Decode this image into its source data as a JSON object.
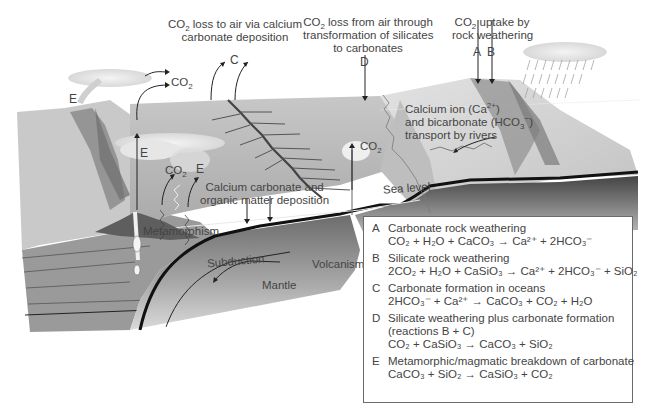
{
  "diagram": {
    "title_labels": {
      "c_label": {
        "line1_pre": "CO",
        "line1_sub": "2",
        "line1_post": " loss to air via calcium",
        "line2": "carbonate deposition",
        "letter": "C"
      },
      "d_label": {
        "line1_pre": "CO",
        "line1_sub": "2",
        "line1_post": " loss from air through",
        "line2": "transformation of silicates",
        "line3": "to carbonates",
        "letter": "D"
      },
      "ab_label": {
        "line1_pre": "CO",
        "line1_sub": "2",
        "line1_post": " uptake by",
        "line2": "rock weathering",
        "letter_a": "A",
        "letter_b": "B"
      }
    },
    "inline_labels": {
      "co2_top": {
        "pre": "CO",
        "sub": "2"
      },
      "co2_mid": {
        "pre": "CO",
        "sub": "2"
      },
      "co2_volcano": {
        "pre": "CO",
        "sub": "2"
      },
      "e_top": "E",
      "e_mid": "E",
      "e_small": "E",
      "river_line1_pre": "Calcium ion (Ca",
      "river_line1_sup": "2+",
      "river_line1_post": ")",
      "river_line2_pre": "and bicarbonate (HCO",
      "river_line2_sub": "3",
      "river_line2_sup": "−",
      "river_line2_post": ")",
      "river_line3": "transport by rivers",
      "deposition_line1": "Calcium carbonate and",
      "deposition_line2": "organic matter deposition",
      "sea_level": "Sea level",
      "metamorphism": "Metamorphism",
      "subduction": "Subduction",
      "volcanism": "Volcanism",
      "mantle": "Mantle"
    },
    "colors": {
      "ocean": "#b9b9b9",
      "land": "#d4d4d4",
      "crust_dark": "#5a5a5a",
      "outline": "#111111",
      "text": "#444444",
      "legend_border": "#6a6a6a"
    }
  },
  "legend": {
    "items": [
      {
        "key": "A",
        "title": "Carbonate rock weathering",
        "equation": "CO₂ + H₂O + CaCO₃ → Ca²⁺ + 2HCO₃⁻"
      },
      {
        "key": "B",
        "title": "Silicate rock weathering",
        "equation": "2CO₂ + H₂O + CaSiO₃ → Ca²⁺ + 2HCO₃⁻ + SiO₂"
      },
      {
        "key": "C",
        "title": "Carbonate formation in oceans",
        "equation": "2HCO₃⁻ + Ca²⁺ → CaCO₃ + CO₂ + H₂O"
      },
      {
        "key": "D",
        "title": "Silicate weathering plus carbonate formation",
        "subtitle": "(reactions B + C)",
        "equation": "CO₂ + CaSiO₃ → CaCO₃ + SiO₂"
      },
      {
        "key": "E",
        "title": "Metamorphic/magmatic breakdown of carbonate",
        "equation": "CaCO₃ + SiO₂ → CaSiO₃ + CO₂"
      }
    ]
  }
}
